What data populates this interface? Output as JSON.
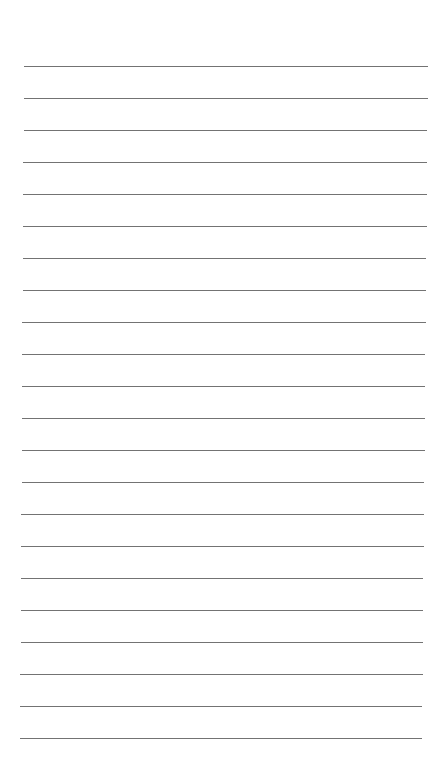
{
  "page": {
    "type": "lined-paper",
    "background_color": "#ffffff",
    "line_color": "#5a5a5a",
    "line_count": 22,
    "first_line_y": 66,
    "line_spacing": 32,
    "line_left_start": 24,
    "line_right_start": 428,
    "line_left_end": 20,
    "line_right_end": 422
  }
}
